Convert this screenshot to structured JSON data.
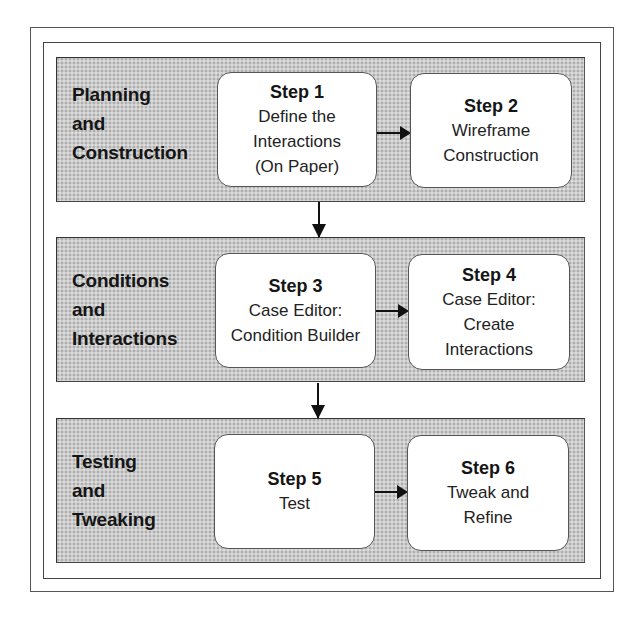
{
  "diagram": {
    "phases": [
      {
        "title_lines": [
          "Planning",
          "and",
          "Construction"
        ],
        "steps": [
          {
            "title": "Step 1",
            "lines": [
              "Define the",
              "Interactions",
              "(On Paper)"
            ]
          },
          {
            "title": "Step 2",
            "lines": [
              "Wireframe",
              "Construction"
            ]
          }
        ]
      },
      {
        "title_lines": [
          "Conditions",
          "and",
          "Interactions"
        ],
        "steps": [
          {
            "title": "Step 3",
            "lines": [
              "Case Editor:",
              "Condition Builder"
            ]
          },
          {
            "title": "Step 4",
            "lines": [
              "Case Editor:",
              "Create",
              "Interactions"
            ]
          }
        ]
      },
      {
        "title_lines": [
          "Testing",
          "and",
          "Tweaking"
        ],
        "steps": [
          {
            "title": "Step 5",
            "lines": [
              "Test"
            ]
          },
          {
            "title": "Step 6",
            "lines": [
              "Tweak and",
              "Refine"
            ]
          }
        ]
      }
    ],
    "connections": [
      {
        "from": "Step 1",
        "to": "Step 2",
        "direction": "right"
      },
      {
        "from": "Planning and Construction",
        "to": "Conditions and Interactions",
        "direction": "down"
      },
      {
        "from": "Step 3",
        "to": "Step 4",
        "direction": "right"
      },
      {
        "from": "Conditions and Interactions",
        "to": "Testing and Tweaking",
        "direction": "down"
      },
      {
        "from": "Step 5",
        "to": "Step 6",
        "direction": "right"
      }
    ],
    "colors": {
      "panel_fill": "#cbcbcb",
      "box_fill": "#ffffff",
      "border": "#444444",
      "arrow": "#111111"
    }
  }
}
